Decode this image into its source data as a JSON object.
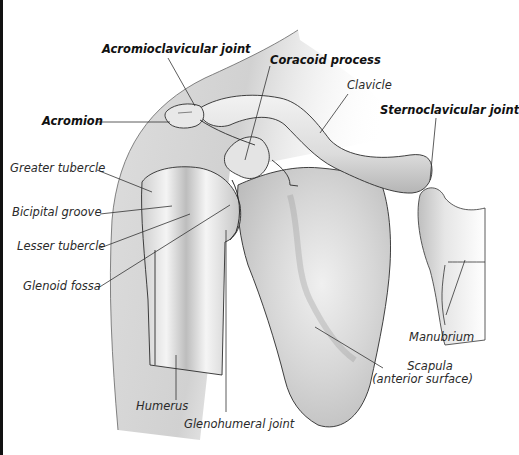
{
  "diagram": {
    "colors": {
      "background": "#ffffff",
      "bone_fill": "#dcdcdc",
      "bone_light": "#f2f2f2",
      "bone_shadow": "#9a9a9a",
      "outline": "#2b2b2b",
      "silhouette": "#cfcfcf",
      "leader_line": "#333333"
    },
    "labels": [
      {
        "id": "acromioclavicular-joint",
        "text": "Acromioclavicular joint",
        "bold": true
      },
      {
        "id": "coracoid-process",
        "text": "Coracoid process",
        "bold": true
      },
      {
        "id": "clavicle",
        "text": "Clavicle",
        "bold": false
      },
      {
        "id": "sternoclavicular-joint",
        "text": "Sternoclavicular joint",
        "bold": true
      },
      {
        "id": "acromion",
        "text": "Acromion",
        "bold": true
      },
      {
        "id": "greater-tubercle",
        "text": "Greater tubercle",
        "bold": false
      },
      {
        "id": "bicipital-groove",
        "text": "Bicipital groove",
        "bold": false
      },
      {
        "id": "lesser-tubercle",
        "text": "Lesser tubercle",
        "bold": false
      },
      {
        "id": "glenoid-fossa",
        "text": "Glenoid fossa",
        "bold": false
      },
      {
        "id": "manubrium",
        "text": "Manubrium",
        "bold": false
      },
      {
        "id": "scapula",
        "text": "Scapula",
        "bold": false
      },
      {
        "id": "scapula-sub",
        "text": "(anterior surface)",
        "bold": false
      },
      {
        "id": "humerus",
        "text": "Humerus",
        "bold": false
      },
      {
        "id": "glenohumeral-joint",
        "text": "Glenohumeral joint",
        "bold": false
      }
    ]
  }
}
